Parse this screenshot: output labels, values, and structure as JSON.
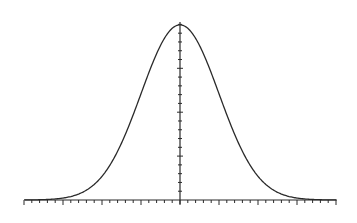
{
  "chart_data": {
    "type": "line",
    "title": "",
    "subtitle": "",
    "xlabel": "",
    "ylabel": "",
    "function": "standard_normal_pdf",
    "mean": 0,
    "std": 1,
    "xlim": [
      -4,
      4
    ],
    "ylim": [
      0,
      0.4
    ],
    "x_ticks": {
      "major": [
        -4,
        -3,
        -2,
        -1,
        0,
        1,
        2,
        3,
        4
      ],
      "minor_step": 0.2,
      "labels_shown": false
    },
    "y_ticks": {
      "major": [
        0.1,
        0.2,
        0.3
      ],
      "minor_step": 0.02,
      "labels_shown": false
    },
    "grid": false,
    "legend": null,
    "x": [
      -4,
      -3.5,
      -3,
      -2.5,
      -2,
      -1.5,
      -1,
      -0.5,
      0,
      0.5,
      1,
      1.5,
      2,
      2.5,
      3,
      3.5,
      4
    ],
    "series": [
      {
        "name": "N(0,1) pdf",
        "values": [
          0.0001,
          0.0009,
          0.0044,
          0.0175,
          0.054,
          0.1295,
          0.242,
          0.3521,
          0.3989,
          0.3521,
          0.242,
          0.1295,
          0.054,
          0.0175,
          0.0044,
          0.0009,
          0.0001
        ]
      }
    ],
    "colors": {
      "curve": "#2a2a2a",
      "axes": "#2a2a2a",
      "background": "#ffffff"
    }
  },
  "layout": {
    "origin_px": [
      180,
      200
    ],
    "px_per_x_unit": 39,
    "px_per_y_unit": 439,
    "x_axis_px": [
      25,
      337
    ],
    "y_axis_top_px": 22
  }
}
